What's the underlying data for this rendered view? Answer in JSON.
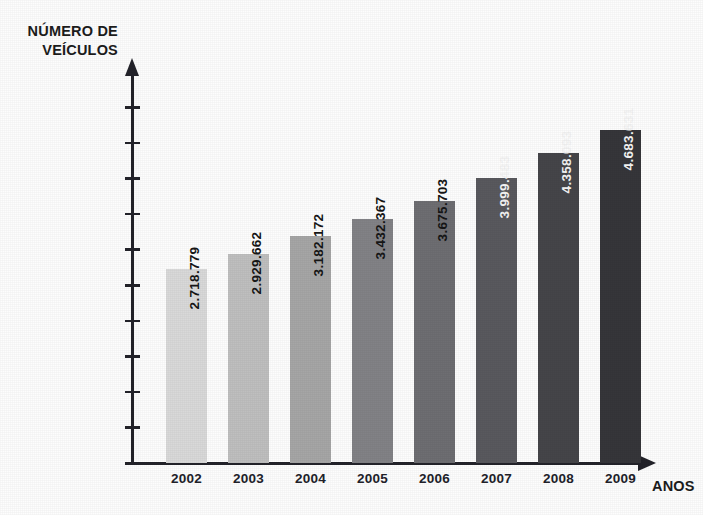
{
  "chart_data": {
    "type": "bar",
    "title": "",
    "xlabel": "ANOS",
    "ylabel_line1": "NÚMERO DE",
    "ylabel_line2": "VEÍCULOS",
    "categories": [
      "2002",
      "2003",
      "2004",
      "2005",
      "2006",
      "2007",
      "2008",
      "2009"
    ],
    "values": [
      2718779,
      2929662,
      3182172,
      3432367,
      3675703,
      3999483,
      4358093,
      4683631
    ],
    "value_labels": [
      "2.718.779",
      "2.929.662",
      "3.182.172",
      "3.432.367",
      "3.675.703",
      "3.999.483",
      "4.358.093",
      "4.683.631"
    ],
    "bar_colors": [
      "#d9d9d9",
      "#bfbfbf",
      "#a6a6a6",
      "#828286",
      "#6e6e72",
      "#59595e",
      "#454549",
      "#36363a"
    ],
    "label_text_colors": [
      "#161616",
      "#161616",
      "#161616",
      "#161616",
      "#161616",
      "#f4f4f4",
      "#f4f4f4",
      "#f4f4f4"
    ],
    "ylim": [
      0,
      5000000
    ],
    "ytick_values": [
      5000000,
      4500000,
      4000000,
      3500000,
      3000000,
      2500000,
      2000000,
      1500000,
      1000000,
      500000,
      0
    ],
    "ytick_labels": [
      "5.000.000",
      "4.500.000",
      "4.000.000",
      "3.500.000",
      "3.000.000",
      "2.500.000",
      "2.000.000",
      "1.500.000",
      "1.000.000",
      "500.000",
      "0"
    ],
    "grid": false,
    "legend": null,
    "axis_color": "#23232a",
    "background_color": "#fdfdfd"
  },
  "layout": {
    "plot_left_px": 134,
    "plot_baseline_px": 463,
    "plot_top_px": 107,
    "bar_width_px": 41,
    "bar_pitch_px": 62,
    "first_bar_left_px": 166
  }
}
